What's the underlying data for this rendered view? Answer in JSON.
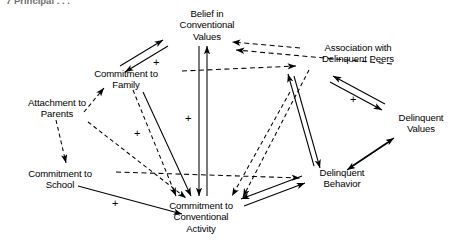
{
  "figure": {
    "caption_fragment": "7   Principal   . . .",
    "background_color": "#ffffff",
    "line_color": "#000000"
  },
  "nodes": [
    {
      "id": "belief-conventional-values",
      "label": "Belief in\nConventional\nValues",
      "x": 151,
      "y": 8,
      "width": 112
    },
    {
      "id": "association-delinquent-peers",
      "label": "Association with\nDelinquent Peers",
      "x": 302,
      "y": 42,
      "width": 112
    },
    {
      "id": "commitment-family",
      "label": "Commitment to\nFamily",
      "x": 74,
      "y": 68,
      "width": 104
    },
    {
      "id": "attachment-parents",
      "label": "Attachment to\nParents",
      "x": 8,
      "y": 97,
      "width": 98
    },
    {
      "id": "delinquent-values",
      "label": "Delinquent\nValues",
      "x": 386,
      "y": 112,
      "width": 70
    },
    {
      "id": "commitment-school",
      "label": "Commitment to\nSchool",
      "x": 8,
      "y": 168,
      "width": 104
    },
    {
      "id": "delinquent-behavior",
      "label": "Delinquent\nBehavior",
      "x": 306,
      "y": 167,
      "width": 72
    },
    {
      "id": "commitment-conventional-activity",
      "label": "Commitment to\nConventional\nActivity",
      "x": 149,
      "y": 200,
      "width": 104
    }
  ],
  "signs": [
    {
      "id": "sign-family-belief",
      "text": "+",
      "x": 153,
      "y": 57
    },
    {
      "id": "sign-peers-values",
      "text": "+",
      "x": 350,
      "y": 94
    },
    {
      "id": "sign-family-activity",
      "text": "+",
      "x": 134,
      "y": 128
    },
    {
      "id": "sign-belief-activity",
      "text": "+",
      "x": 185,
      "y": 113
    },
    {
      "id": "sign-school-activity",
      "text": "+",
      "x": 112,
      "y": 198
    }
  ],
  "edges": [
    {
      "id": "edge-family-to-belief",
      "style": "solid",
      "arrow": "single"
    },
    {
      "id": "edge-belief-to-family",
      "style": "solid",
      "arrow": "single"
    },
    {
      "id": "edge-peers-to-belief",
      "style": "dashed",
      "arrow": "single"
    },
    {
      "id": "edge-values-to-belief",
      "style": "dashed",
      "arrow": "single"
    },
    {
      "id": "edge-family-to-peers",
      "style": "dashed",
      "arrow": "single"
    },
    {
      "id": "edge-peers-to-values",
      "style": "solid",
      "arrow": "double"
    },
    {
      "id": "edge-values-to-behavior",
      "style": "solid",
      "arrow": "double"
    },
    {
      "id": "edge-belief-to-activity",
      "style": "solid",
      "arrow": "double"
    },
    {
      "id": "edge-parents-to-family",
      "style": "dashed",
      "arrow": "single"
    },
    {
      "id": "edge-parents-to-school",
      "style": "dashed",
      "arrow": "single"
    },
    {
      "id": "edge-parents-to-activity",
      "style": "dashed",
      "arrow": "single"
    },
    {
      "id": "edge-family-to-activity",
      "style": "solid",
      "arrow": "single"
    },
    {
      "id": "edge-family-to-activity-dashed",
      "style": "dashed",
      "arrow": "single"
    },
    {
      "id": "edge-school-to-activity",
      "style": "solid",
      "arrow": "single"
    },
    {
      "id": "edge-school-to-behavior",
      "style": "dashed",
      "arrow": "single"
    },
    {
      "id": "edge-activity-to-behavior",
      "style": "solid",
      "arrow": "double"
    },
    {
      "id": "edge-peers-to-activity",
      "style": "dashed",
      "arrow": "single"
    },
    {
      "id": "edge-values-to-activity",
      "style": "dashed",
      "arrow": "single"
    },
    {
      "id": "edge-behavior-to-belief",
      "style": "solid",
      "arrow": "single"
    }
  ]
}
